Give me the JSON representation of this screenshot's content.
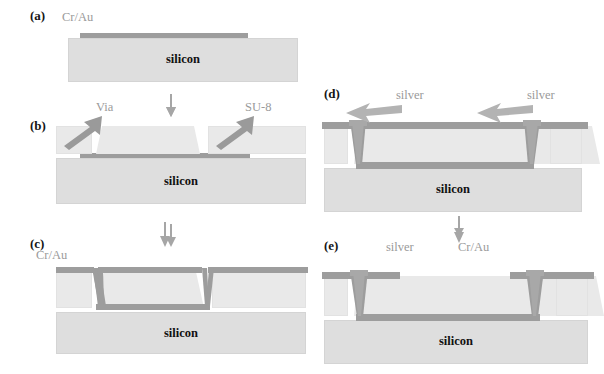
{
  "figure": {
    "type": "process-flow-cross-section",
    "panel_count": 5
  },
  "colors": {
    "silicon": "#dedede",
    "su8": "#e9e9e9",
    "metal_cr_au": "#9d9d9d",
    "silver": "#a8a8a8",
    "annotation_text": "#9a9a9a",
    "panel_tag_text": "#151515",
    "background": "#ffffff"
  },
  "panels": [
    {
      "id": "a",
      "tag": "(a)",
      "substrate_label": "silicon",
      "annotations": [
        {
          "name": "cr-au",
          "text": "Cr/Au"
        }
      ]
    },
    {
      "id": "b",
      "tag": "(b)",
      "substrate_label": "silicon",
      "annotations": [
        {
          "name": "via",
          "text": "Via"
        },
        {
          "name": "su8",
          "text": "SU-8"
        }
      ]
    },
    {
      "id": "c",
      "tag": "(c)",
      "substrate_label": "silicon",
      "annotations": [
        {
          "name": "cr-au",
          "text": "Cr/Au"
        }
      ]
    },
    {
      "id": "d",
      "tag": "(d)",
      "substrate_label": "silicon",
      "annotations": [
        {
          "name": "silver-left",
          "text": "silver"
        },
        {
          "name": "silver-right",
          "text": "silver"
        }
      ]
    },
    {
      "id": "e",
      "tag": "(e)",
      "substrate_label": "silicon",
      "annotations": [
        {
          "name": "silver",
          "text": "silver"
        },
        {
          "name": "cr-au",
          "text": "Cr/Au"
        }
      ]
    }
  ],
  "flow_arrows": [
    {
      "name": "arrow-a-to-b",
      "direction": "down"
    },
    {
      "name": "arrow-b-to-c",
      "direction": "down"
    },
    {
      "name": "arrow-d-to-e",
      "direction": "down"
    }
  ]
}
